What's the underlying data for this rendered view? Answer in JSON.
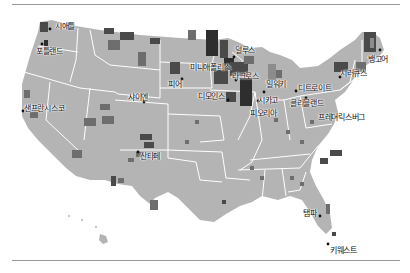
{
  "map": {
    "title": "",
    "colors": {
      "land": "#b4b4b4",
      "border": "#ffffff",
      "low": "#8c8c8c",
      "mid": "#6e6e6e",
      "high": "#4a4a4a",
      "highest": "#2e2e2e",
      "dot": "#111111",
      "rule": "#9a9a9a"
    },
    "cities": [
      {
        "name": "시애틀",
        "x": 50,
        "y": 28
      },
      {
        "name": "포틀랜드",
        "x": 36,
        "y": 49
      },
      {
        "name": "샌프란시스코",
        "x": 24,
        "y": 104
      },
      {
        "name": "샤이엔",
        "x": 128,
        "y": 93
      },
      {
        "name": "피어",
        "x": 168,
        "y": 81
      },
      {
        "name": "미니애폴리스",
        "x": 190,
        "y": 66
      },
      {
        "name": "덜루스",
        "x": 233,
        "y": 48
      },
      {
        "name": "라크로스",
        "x": 230,
        "y": 73
      },
      {
        "name": "디모인스",
        "x": 200,
        "y": 92
      },
      {
        "name": "밀워키",
        "x": 265,
        "y": 81
      },
      {
        "name": "시카고",
        "x": 256,
        "y": 97
      },
      {
        "name": "피오리아",
        "x": 253,
        "y": 110
      },
      {
        "name": "디트로이트",
        "x": 300,
        "y": 87
      },
      {
        "name": "클리블랜드",
        "x": 290,
        "y": 100
      },
      {
        "name": "프레더릭스버그",
        "x": 318,
        "y": 114
      },
      {
        "name": "시러큐스",
        "x": 340,
        "y": 71
      },
      {
        "name": "뱅고어",
        "x": 370,
        "y": 57
      },
      {
        "name": "산타페",
        "x": 140,
        "y": 152
      },
      {
        "name": "탬파",
        "x": 307,
        "y": 211
      },
      {
        "name": "키웨스트",
        "x": 330,
        "y": 248
      }
    ]
  }
}
